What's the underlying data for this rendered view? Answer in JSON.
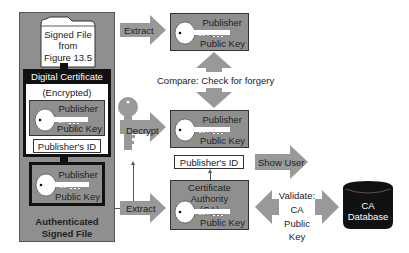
{
  "colors": {
    "box_gray": "#8f8f8f",
    "arrow_gray": "#999999",
    "dark": "#111111",
    "white": "#ffffff"
  },
  "left_panel": {
    "folder": {
      "line1": "Signed File",
      "line2": "from",
      "line3": "Figure 13.5"
    },
    "certificate": {
      "header": "Digital Certificate",
      "subtitle": "(Encrypted)",
      "key": {
        "top_label": "Publisher",
        "bottom_label": "Public Key"
      },
      "id_label": "Publisher's ID"
    },
    "bottom_key": {
      "top_label": "Publisher",
      "bottom_label": "Public Key"
    },
    "caption": {
      "line1": "Authenticated",
      "line2": "Signed File"
    }
  },
  "arrows": {
    "extract_top": "Extract",
    "decrypt": "Decrypt",
    "extract_bottom": "Extract",
    "show_user": "Show User",
    "compare": "Compare: Check for forgery",
    "validate": {
      "line1": "Validate:",
      "line2": "CA",
      "line3": "Public Key"
    }
  },
  "middle": {
    "top_key": {
      "top_label": "Publisher",
      "bottom_label": "Public Key"
    },
    "decrypted_key": {
      "top_label": "Publisher",
      "bottom_label": "Public Key"
    },
    "id_label": "Publisher's ID",
    "ca_box": {
      "title_line1": "Certificate Authority",
      "title_line2": "(CA)",
      "bottom_label": "Public Key"
    }
  },
  "database": {
    "line1": "CA",
    "line2": "Database"
  }
}
